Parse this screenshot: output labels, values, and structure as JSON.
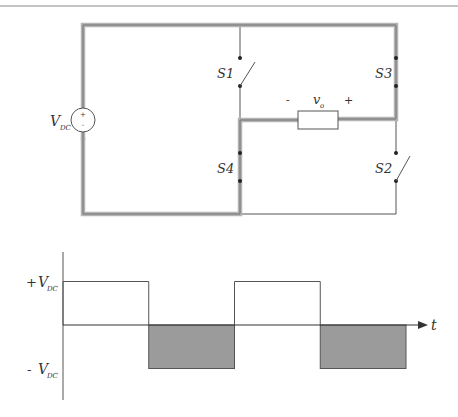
{
  "circuit": {
    "source": {
      "label": "V",
      "subscript": "DC",
      "plus": "+",
      "minus": "-"
    },
    "switches": {
      "s1": "S1",
      "s2": "S2",
      "s3": "S3",
      "s4": "S4"
    },
    "load": {
      "label": "v",
      "subscript": "o",
      "minus": "-",
      "plus": "+"
    },
    "colors": {
      "thick_wire": "#a8a8a8",
      "thick_wire_core": "#707070",
      "thin_wire": "#555555"
    }
  },
  "waveform": {
    "y_pos_label": {
      "sign": "+ ",
      "label": "V",
      "subscript": "DC"
    },
    "y_neg_label": {
      "sign": "- ",
      "label": "V",
      "subscript": "DC"
    },
    "t_label": "t",
    "fill_color": "#9b9b9b"
  },
  "chart_data": {
    "type": "line",
    "title": "",
    "xlabel": "t",
    "ylabel": "",
    "x": [
      0,
      1,
      1,
      2,
      2,
      3,
      3,
      4
    ],
    "y": [
      1,
      1,
      -1,
      -1,
      1,
      1,
      -1,
      -1
    ],
    "y_units": "V_DC",
    "ylim": [
      -1,
      1
    ],
    "half_periods": [
      {
        "start": 0,
        "end": 1,
        "level": 1,
        "shaded": false
      },
      {
        "start": 1,
        "end": 2,
        "level": -1,
        "shaded": true
      },
      {
        "start": 2,
        "end": 3,
        "level": 1,
        "shaded": false
      },
      {
        "start": 3,
        "end": 4,
        "level": -1,
        "shaded": true
      }
    ],
    "tick_labels": [
      "+ V_DC",
      "- V_DC"
    ]
  }
}
